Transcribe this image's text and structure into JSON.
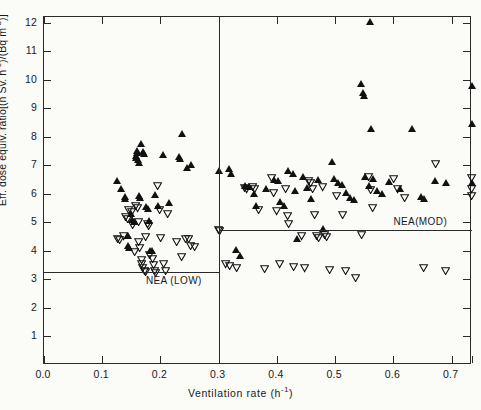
{
  "figure": {
    "xlabel_prefix": "Ventilation rate (h",
    "xlabel_exp": "-1",
    "xlabel_suffix": ")",
    "ytitle_text": "Eff. dose equiv. ratio[(n Sv. h⁻¹)/(Bq m⁻³)]"
  },
  "axes": {
    "x_ticks": [
      "0.0",
      "0.1",
      "0.2",
      "0.3",
      "0.4",
      "0.5",
      "0.6",
      "0.7"
    ],
    "x_tick_values": [
      0.0,
      0.1,
      0.2,
      0.3,
      0.4,
      0.5,
      0.6,
      0.7
    ],
    "y_ticks": [
      "1",
      "2",
      "3",
      "4",
      "5",
      "6",
      "7",
      "8",
      "9",
      "10",
      "11",
      "12"
    ],
    "y_tick_values": [
      1,
      2,
      3,
      4,
      5,
      6,
      7,
      8,
      9,
      10,
      11,
      12
    ],
    "xlim": [
      0.0,
      0.735
    ],
    "ylim": [
      0.0,
      12.2
    ]
  },
  "annotations": {
    "nea_low_label": "NEA (LOW)",
    "nea_low_value": 3.25,
    "nea_mod_label": "NEA(MOD)",
    "nea_mod_value": 4.72,
    "divider_value": 0.3
  },
  "chart_data": {
    "type": "scatter",
    "title": "",
    "xlabel": "Ventilation rate (h-1)",
    "ylabel": "Eff. dose equiv. ratio[(n Sv. h-1)/(Bq m-3)]",
    "xlim": [
      0.0,
      0.735
    ],
    "ylim": [
      0.0,
      12.2
    ],
    "grid": false,
    "legend": "none",
    "reference_lines": [
      {
        "label": "NEA (LOW)",
        "y": 3.25,
        "x_from": 0.0,
        "x_to": 0.3
      },
      {
        "label": "NEA(MOD)",
        "y": 4.72,
        "x_from": 0.3,
        "x_to": 0.735
      },
      {
        "label": "divider",
        "x": 0.3,
        "orientation": "vertical"
      }
    ],
    "series": [
      {
        "name": "filled-up-triangle",
        "marker": "triangle-up",
        "fill": "#111111",
        "points": [
          [
            0.126,
            6.45
          ],
          [
            0.133,
            6.2
          ],
          [
            0.139,
            5.92
          ],
          [
            0.139,
            5.85
          ],
          [
            0.144,
            4.55
          ],
          [
            0.144,
            4.2
          ],
          [
            0.146,
            4.12
          ],
          [
            0.15,
            5.3
          ],
          [
            0.152,
            5.1
          ],
          [
            0.155,
            5.02
          ],
          [
            0.158,
            7.35
          ],
          [
            0.158,
            7.27
          ],
          [
            0.16,
            7.52
          ],
          [
            0.16,
            7.45
          ],
          [
            0.162,
            7.2
          ],
          [
            0.163,
            7.1
          ],
          [
            0.164,
            5.95
          ],
          [
            0.165,
            5.88
          ],
          [
            0.167,
            7.75
          ],
          [
            0.17,
            7.48
          ],
          [
            0.172,
            7.4
          ],
          [
            0.176,
            5.55
          ],
          [
            0.178,
            5.48
          ],
          [
            0.18,
            5.05
          ],
          [
            0.182,
            4.0
          ],
          [
            0.186,
            4.02
          ],
          [
            0.19,
            5.98
          ],
          [
            0.196,
            5.6
          ],
          [
            0.205,
            7.38
          ],
          [
            0.215,
            5.7
          ],
          [
            0.232,
            7.3
          ],
          [
            0.234,
            7.22
          ],
          [
            0.238,
            8.12
          ],
          [
            0.246,
            6.92
          ],
          [
            0.252,
            7.02
          ],
          [
            0.3,
            6.82
          ],
          [
            0.318,
            6.88
          ],
          [
            0.322,
            6.72
          ],
          [
            0.33,
            4.05
          ],
          [
            0.336,
            3.82
          ],
          [
            0.345,
            6.28
          ],
          [
            0.352,
            6.25
          ],
          [
            0.36,
            6.02
          ],
          [
            0.365,
            5.6
          ],
          [
            0.382,
            6.18
          ],
          [
            0.395,
            6.5
          ],
          [
            0.402,
            6.48
          ],
          [
            0.405,
            5.72
          ],
          [
            0.412,
            5.58
          ],
          [
            0.42,
            6.82
          ],
          [
            0.428,
            6.7
          ],
          [
            0.432,
            6.12
          ],
          [
            0.435,
            4.42
          ],
          [
            0.445,
            6.6
          ],
          [
            0.452,
            6.22
          ],
          [
            0.458,
            5.82
          ],
          [
            0.47,
            6.5
          ],
          [
            0.48,
            4.78
          ],
          [
            0.495,
            7.12
          ],
          [
            0.498,
            6.55
          ],
          [
            0.505,
            6.4
          ],
          [
            0.512,
            6.32
          ],
          [
            0.518,
            6.05
          ],
          [
            0.525,
            5.88
          ],
          [
            0.532,
            5.8
          ],
          [
            0.545,
            9.88
          ],
          [
            0.548,
            9.55
          ],
          [
            0.55,
            9.45
          ],
          [
            0.552,
            6.6
          ],
          [
            0.558,
            6.3
          ],
          [
            0.56,
            12.05
          ],
          [
            0.562,
            8.28
          ],
          [
            0.565,
            6.55
          ],
          [
            0.572,
            6.1
          ],
          [
            0.58,
            6.0
          ],
          [
            0.592,
            6.42
          ],
          [
            0.612,
            6.2
          ],
          [
            0.632,
            8.28
          ],
          [
            0.648,
            5.92
          ],
          [
            0.652,
            5.85
          ],
          [
            0.672,
            6.45
          ],
          [
            0.69,
            6.4
          ],
          [
            0.735,
            9.8
          ],
          [
            0.735,
            8.48
          ],
          [
            0.735,
            6.38
          ]
        ]
      },
      {
        "name": "open-down-triangle",
        "marker": "triangle-down",
        "fill": "none",
        "points": [
          [
            0.126,
            4.42
          ],
          [
            0.13,
            4.38
          ],
          [
            0.136,
            4.5
          ],
          [
            0.14,
            5.18
          ],
          [
            0.143,
            5.12
          ],
          [
            0.146,
            5.42
          ],
          [
            0.15,
            5.35
          ],
          [
            0.152,
            4.9
          ],
          [
            0.155,
            3.95
          ],
          [
            0.158,
            5.58
          ],
          [
            0.16,
            5.48
          ],
          [
            0.162,
            5.0
          ],
          [
            0.163,
            4.32
          ],
          [
            0.165,
            4.1
          ],
          [
            0.167,
            3.68
          ],
          [
            0.168,
            3.52
          ],
          [
            0.17,
            3.4
          ],
          [
            0.172,
            3.3
          ],
          [
            0.174,
            3.25
          ],
          [
            0.175,
            4.48
          ],
          [
            0.178,
            4.95
          ],
          [
            0.18,
            4.88
          ],
          [
            0.182,
            3.85
          ],
          [
            0.186,
            3.7
          ],
          [
            0.188,
            3.5
          ],
          [
            0.19,
            3.3
          ],
          [
            0.192,
            3.22
          ],
          [
            0.195,
            6.28
          ],
          [
            0.198,
            5.42
          ],
          [
            0.2,
            4.45
          ],
          [
            0.205,
            3.52
          ],
          [
            0.208,
            3.28
          ],
          [
            0.212,
            5.28
          ],
          [
            0.228,
            4.32
          ],
          [
            0.236,
            3.78
          ],
          [
            0.244,
            4.42
          ],
          [
            0.248,
            4.4
          ],
          [
            0.252,
            4.18
          ],
          [
            0.258,
            4.12
          ],
          [
            0.3,
            4.72
          ],
          [
            0.302,
            4.68
          ],
          [
            0.312,
            3.52
          ],
          [
            0.318,
            3.48
          ],
          [
            0.33,
            3.4
          ],
          [
            0.345,
            6.2
          ],
          [
            0.348,
            6.15
          ],
          [
            0.358,
            6.25
          ],
          [
            0.362,
            6.18
          ],
          [
            0.368,
            5.42
          ],
          [
            0.378,
            3.35
          ],
          [
            0.39,
            6.55
          ],
          [
            0.394,
            6.02
          ],
          [
            0.4,
            5.38
          ],
          [
            0.405,
            3.52
          ],
          [
            0.415,
            6.18
          ],
          [
            0.418,
            5.22
          ],
          [
            0.42,
            4.95
          ],
          [
            0.428,
            3.42
          ],
          [
            0.442,
            4.5
          ],
          [
            0.448,
            3.38
          ],
          [
            0.455,
            6.45
          ],
          [
            0.458,
            6.38
          ],
          [
            0.462,
            6.18
          ],
          [
            0.465,
            5.25
          ],
          [
            0.468,
            4.52
          ],
          [
            0.472,
            4.45
          ],
          [
            0.478,
            6.22
          ],
          [
            0.482,
            4.55
          ],
          [
            0.485,
            4.48
          ],
          [
            0.49,
            3.32
          ],
          [
            0.502,
            5.92
          ],
          [
            0.512,
            5.25
          ],
          [
            0.518,
            3.3
          ],
          [
            0.535,
            3.05
          ],
          [
            0.545,
            4.55
          ],
          [
            0.558,
            6.6
          ],
          [
            0.56,
            6.12
          ],
          [
            0.565,
            5.5
          ],
          [
            0.6,
            6.52
          ],
          [
            0.608,
            6.15
          ],
          [
            0.62,
            5.85
          ],
          [
            0.652,
            3.4
          ],
          [
            0.672,
            7.05
          ],
          [
            0.69,
            3.28
          ],
          [
            0.735,
            6.55
          ],
          [
            0.735,
            6.15
          ],
          [
            0.735,
            5.92
          ]
        ]
      }
    ]
  }
}
